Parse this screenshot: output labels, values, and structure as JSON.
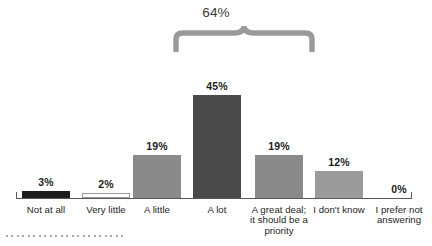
{
  "chart_data": {
    "type": "bar",
    "title": "",
    "subtitle": "",
    "xlabel": "",
    "ylabel": "",
    "ylim": [
      0,
      50
    ],
    "grid": false,
    "legend": false,
    "categories": [
      "Not at all",
      "Very little",
      "A little",
      "A lot",
      "A great deal;\nit should be a\npriority",
      "I don't know",
      "I prefer not\nanswering"
    ],
    "values": [
      3,
      2,
      19,
      45,
      19,
      12,
      0
    ],
    "value_labels": [
      "3%",
      "2%",
      "19%",
      "45%",
      "19%",
      "12%",
      "0%"
    ],
    "bar_colors": [
      "#1c1c1c",
      "#ffffff",
      "#8a8a8a",
      "#4a4a4a",
      "#8a8a8a",
      "#9b9b9b",
      "#ffffff"
    ],
    "bar_border_colors": [
      "#1c1c1c",
      "#9a9a9a",
      "#8a8a8a",
      "#4a4a4a",
      "#8a8a8a",
      "#9b9b9b",
      "#ffffff"
    ],
    "annotations": [
      {
        "name": "combined-total-brace",
        "label": "64%",
        "spans_categories": [
          "A lot",
          "A great deal;\nit should be a\npriority"
        ],
        "value": 64,
        "color": "#9a9a9a"
      }
    ]
  },
  "annotation": {
    "total_label": "64%"
  },
  "decoration": {
    "dot_count": 22,
    "dot_color": "#8d8d8d"
  }
}
